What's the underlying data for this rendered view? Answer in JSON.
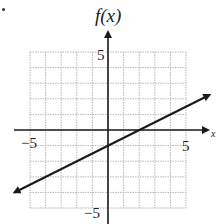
{
  "chart_data": {
    "type": "line",
    "title": "",
    "xlabel": "x",
    "ylabel": "f(x)",
    "xlim": [
      -5,
      5
    ],
    "ylim": [
      -5,
      5
    ],
    "grid": true,
    "x_ticks_labeled": [
      "-5",
      "5"
    ],
    "y_ticks_labeled": [
      "5",
      "-5"
    ],
    "series": [
      {
        "name": "f(x)",
        "equation": "f(x) = 0.5x - 1",
        "slope": 0.5,
        "y_intercept": -1,
        "x_intercept": 2,
        "arrows_both_ends": true,
        "points": [
          [
            -6,
            -4
          ],
          [
            0,
            -1
          ],
          [
            2,
            0
          ],
          [
            6.5,
            2.25
          ]
        ]
      }
    ]
  },
  "labels": {
    "y_axis": "f(x)",
    "x_axis": "x",
    "x_min": "−5",
    "x_max": "5",
    "y_max": "5",
    "y_min": "−5"
  },
  "colors": {
    "grid": "#b8b8b8",
    "axis": "#1a1a1a",
    "line": "#1a1a1a"
  }
}
